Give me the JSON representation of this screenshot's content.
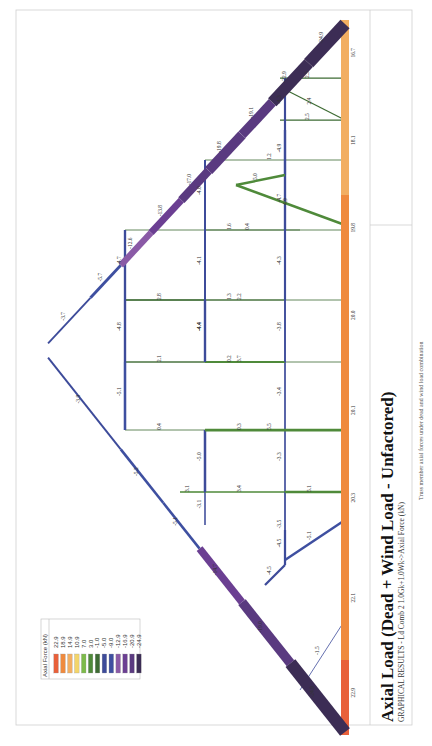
{
  "title": "Axial Load (Dead + Wind Load - Unfactored)",
  "subtitle": "GRAPHICAL RESULTS - Ld Comb 2 1.0Gk+1.0Wk->Axial Force (kN)",
  "caption": "Truss member axial forces under dead and wind load combination",
  "legend": {
    "title": "Axial Force (kN)",
    "entries": [
      {
        "value": "22.9",
        "color": "#e8603a"
      },
      {
        "value": "18.9",
        "color": "#ef8a3e"
      },
      {
        "value": "14.9",
        "color": "#f2ae62"
      },
      {
        "value": "10.9",
        "color": "#f3d56a"
      },
      {
        "value": "7.0",
        "color": "#7dbb4a"
      },
      {
        "value": "3.0",
        "color": "#4f8a3a"
      },
      {
        "value": "-1.0",
        "color": "#3d6b33"
      },
      {
        "value": "-5.0",
        "color": "#3d4b9a"
      },
      {
        "value": "-9.0",
        "color": "#3e4fa0"
      },
      {
        "value": "-12.9",
        "color": "#8a5aa6"
      },
      {
        "value": "-16.9",
        "color": "#6b3f92"
      },
      {
        "value": "-20.9",
        "color": "#5a3a80"
      },
      {
        "value": "-24.9",
        "color": "#3c2d55"
      }
    ]
  },
  "chart_data": {
    "type": "truss-axial-force-diagram",
    "units": "kN",
    "load_combination": "Ld Comb 2 1.0Gk+1.0Wk",
    "members": [
      {
        "id": "bc1",
        "group": "bottom-chord",
        "label": "22.9",
        "value": 22.9
      },
      {
        "id": "bc2",
        "group": "bottom-chord",
        "label": "22.1",
        "value": 22.1
      },
      {
        "id": "bc3",
        "group": "bottom-chord",
        "label": "20.3",
        "value": 20.3
      },
      {
        "id": "bc4",
        "group": "bottom-chord",
        "label": "20.1",
        "value": 20.1
      },
      {
        "id": "bc5",
        "group": "bottom-chord",
        "label": "20.0",
        "value": 20.0
      },
      {
        "id": "bc6",
        "group": "bottom-chord",
        "label": "19.8",
        "value": 19.8
      },
      {
        "id": "bc7",
        "group": "bottom-chord",
        "label": "18.1",
        "value": 18.1
      },
      {
        "id": "bc8",
        "group": "bottom-chord",
        "label": "16.7",
        "value": 16.7
      },
      {
        "id": "lr1",
        "group": "left-rafter",
        "label": "-24.9",
        "value": -24.9
      },
      {
        "id": "lr2",
        "group": "left-rafter",
        "label": "-19.0",
        "value": -19.0
      },
      {
        "id": "lr3",
        "group": "left-rafter",
        "label": "-14.7",
        "value": -14.7
      },
      {
        "id": "lr4",
        "group": "left-rafter",
        "label": "-5.1",
        "value": -5.1
      },
      {
        "id": "lr5",
        "group": "left-rafter",
        "label": "-5.2",
        "value": -5.2
      },
      {
        "id": "lr6",
        "group": "left-rafter",
        "label": "-3.9",
        "value": -3.9
      },
      {
        "id": "rr1",
        "group": "right-rafter",
        "label": "-24.9",
        "value": -24.9
      },
      {
        "id": "rr2",
        "group": "right-rafter",
        "label": "-22.9",
        "value": -22.9
      },
      {
        "id": "rr3",
        "group": "right-rafter",
        "label": "-19.1",
        "value": -19.1
      },
      {
        "id": "rr4",
        "group": "right-rafter",
        "label": "-19.8",
        "value": -19.8
      },
      {
        "id": "rr5",
        "group": "right-rafter",
        "label": "-17.0",
        "value": -17.0
      },
      {
        "id": "rr6",
        "group": "right-rafter",
        "label": "-13.8",
        "value": -13.8
      },
      {
        "id": "rr7",
        "group": "right-rafter",
        "label": "-12.6",
        "value": -12.6
      },
      {
        "id": "rr8",
        "group": "right-rafter",
        "label": "-5.7",
        "value": -5.7
      },
      {
        "id": "rr9",
        "group": "right-rafter",
        "label": "-3.7",
        "value": -3.7
      },
      {
        "id": "v1",
        "group": "web",
        "label": "2.5",
        "value": 2.5
      },
      {
        "id": "v2",
        "group": "web",
        "label": "1.2",
        "value": 1.2
      },
      {
        "id": "v3",
        "group": "web",
        "label": "1.6",
        "value": 1.6
      },
      {
        "id": "v4",
        "group": "web",
        "label": "1.3",
        "value": 1.3
      },
      {
        "id": "v5",
        "group": "web",
        "label": "0.2",
        "value": 0.2
      },
      {
        "id": "v6",
        "group": "web",
        "label": "5.5",
        "value": 5.5
      },
      {
        "id": "v7",
        "group": "web",
        "label": "5.1",
        "value": 5.1
      },
      {
        "id": "d1",
        "group": "web",
        "label": "2.4",
        "value": 2.4
      },
      {
        "id": "d2",
        "group": "web",
        "label": "4.9",
        "value": 4.9
      },
      {
        "id": "d3",
        "group": "web",
        "label": "5.0",
        "value": 5.0
      },
      {
        "id": "d4",
        "group": "web",
        "label": "-5.1",
        "value": -5.1
      },
      {
        "id": "d5",
        "group": "web",
        "label": "-4.5",
        "value": -4.5
      },
      {
        "id": "d6",
        "group": "web",
        "label": "-1.5",
        "value": -1.5
      },
      {
        "id": "h1",
        "group": "tie",
        "label": "0.4",
        "value": 0.4
      },
      {
        "id": "h2",
        "group": "tie",
        "label": "2.8",
        "value": 2.8
      },
      {
        "id": "h3",
        "group": "tie",
        "label": "2.2",
        "value": 2.2
      },
      {
        "id": "h4",
        "group": "tie",
        "label": "2.1",
        "value": 2.1
      },
      {
        "id": "h5",
        "group": "tie",
        "label": "3.7",
        "value": 3.7
      },
      {
        "id": "h6",
        "group": "tie",
        "label": "0.4",
        "value": 0.4
      },
      {
        "id": "h7",
        "group": "tie",
        "label": "0.3",
        "value": 0.3
      },
      {
        "id": "h8",
        "group": "tie",
        "label": "3.4",
        "value": 3.4
      },
      {
        "id": "h9",
        "group": "tie",
        "label": "3.1",
        "value": 3.1
      },
      {
        "id": "h10",
        "group": "tie",
        "label": "2.5",
        "value": 2.5
      },
      {
        "id": "p1",
        "group": "post",
        "label": "-4.0",
        "value": -4.0
      },
      {
        "id": "p2",
        "group": "post",
        "label": "-4.1",
        "value": -4.1
      },
      {
        "id": "p3",
        "group": "post",
        "label": "-4.4",
        "value": -4.4
      },
      {
        "id": "p4",
        "group": "post",
        "label": "-4.8",
        "value": -4.8
      },
      {
        "id": "p5",
        "group": "post",
        "label": "-5.1",
        "value": -5.1
      },
      {
        "id": "p6",
        "group": "post",
        "label": "-5.0",
        "value": -5.0
      },
      {
        "id": "p7",
        "group": "post",
        "label": "-3.1",
        "value": -3.1
      },
      {
        "id": "p8",
        "group": "post",
        "label": "-4.5",
        "value": -4.5
      },
      {
        "id": "p9",
        "group": "post",
        "label": "-4.9",
        "value": -4.9
      },
      {
        "id": "p10",
        "group": "post",
        "label": "-4.7",
        "value": -4.7
      },
      {
        "id": "p11",
        "group": "post",
        "label": "-4.3",
        "value": -4.3
      },
      {
        "id": "p12",
        "group": "post",
        "label": "-3.8",
        "value": -3.8
      },
      {
        "id": "p13",
        "group": "post",
        "label": "-3.4",
        "value": -3.4
      },
      {
        "id": "p14",
        "group": "post",
        "label": "-3.3",
        "value": -3.3
      },
      {
        "id": "p15",
        "group": "post",
        "label": "-3.5",
        "value": -3.5
      },
      {
        "id": "p16",
        "group": "post",
        "label": "-4.4",
        "value": -4.4
      },
      {
        "id": "p17",
        "group": "post",
        "label": "-4.7",
        "value": -4.7
      },
      {
        "id": "p18",
        "group": "post",
        "label": "-4.3",
        "value": -4.3
      }
    ]
  }
}
